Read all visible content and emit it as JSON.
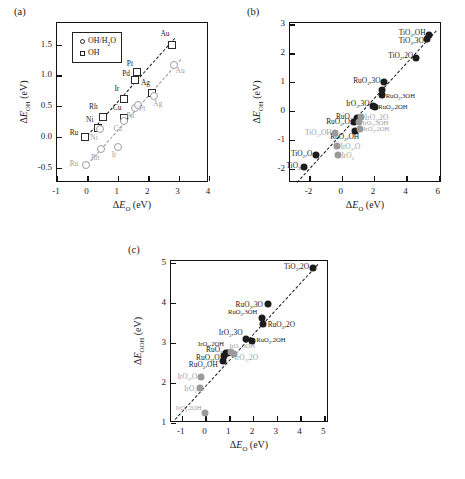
{
  "figure": {
    "background": "#ffffff",
    "colors": {
      "dark": "#1a1a1a",
      "gray": "#9d9d9d",
      "axis": "#111111"
    }
  },
  "panels": [
    {
      "tag": "(a)",
      "name": "panel-a",
      "chart_data": {
        "type": "scatter",
        "title": "",
        "xlabel": "ΔE_O (eV)",
        "ylabel": "ΔE_OH (eV)",
        "xlim": [
          -1,
          4
        ],
        "ylim": [
          -0.75,
          1.85
        ],
        "xticks": [
          -1,
          0,
          1,
          2,
          3,
          4
        ],
        "xticklabels": [
          "-1",
          "0",
          "1",
          "2",
          "3",
          "4"
        ],
        "yticks": [
          -0.5,
          0.0,
          0.5,
          1.0,
          1.5
        ],
        "yticklabels": [
          "-0.5",
          "0.0",
          "0.5",
          "1.0",
          "1.5"
        ],
        "grid": false,
        "legend_position": "upper-left",
        "legend": [
          {
            "label": "OH/H₂O",
            "marker": "circle-open"
          },
          {
            "label": "OH",
            "marker": "square-open"
          }
        ],
        "series": [
          {
            "name": "OH",
            "marker": "square-open",
            "color": "#2a2a2a",
            "points": [
              {
                "label": "Ru",
                "x": -0.08,
                "y": 0.0,
                "lx": -0.3,
                "ly": 0.06,
                "anchor": "right"
              },
              {
                "label": "Ni",
                "x": 0.36,
                "y": 0.14,
                "lx": 0.2,
                "ly": 0.28,
                "anchor": "right"
              },
              {
                "label": "Rh",
                "x": 0.52,
                "y": 0.33,
                "lx": 0.34,
                "ly": 0.48,
                "anchor": "right"
              },
              {
                "label": "Ir",
                "x": 1.2,
                "y": 0.62,
                "lx": 1.05,
                "ly": 0.77,
                "anchor": "right"
              },
              {
                "label": "Cu",
                "x": 1.22,
                "y": 0.3,
                "lx": 1.12,
                "ly": 0.47,
                "anchor": "right"
              },
              {
                "label": "Pd",
                "x": 1.55,
                "y": 0.93,
                "lx": 1.4,
                "ly": 1.02,
                "anchor": "right"
              },
              {
                "label": "Pt",
                "x": 1.62,
                "y": 1.06,
                "lx": 1.5,
                "ly": 1.19,
                "anchor": "right"
              },
              {
                "label": "Ag",
                "x": 2.14,
                "y": 0.71,
                "lx": 2.06,
                "ly": 0.88,
                "anchor": "right"
              },
              {
                "label": "Au",
                "x": 2.78,
                "y": 1.5,
                "lx": 2.7,
                "ly": 1.67,
                "anchor": "right"
              }
            ]
          },
          {
            "name": "OH/H2O",
            "marker": "circle-open",
            "color": "#9d9d9d",
            "points": [
              {
                "label": "Ru",
                "x": -0.05,
                "y": -0.46,
                "lx": -0.3,
                "ly": -0.44,
                "anchor": "right"
              },
              {
                "label": "Rh",
                "x": 0.44,
                "y": -0.2,
                "lx": 0.4,
                "ly": -0.34,
                "anchor": "right"
              },
              {
                "label": "Ni",
                "x": 0.4,
                "y": 0.13,
                "lx": 0.34,
                "ly": -0.02,
                "anchor": "right"
              },
              {
                "label": "Ir",
                "x": 1.0,
                "y": -0.16,
                "lx": 0.96,
                "ly": -0.3,
                "anchor": "right"
              },
              {
                "label": "Cu",
                "x": 1.2,
                "y": 0.26,
                "lx": 1.14,
                "ly": 0.13,
                "anchor": "right"
              },
              {
                "label": "Pd",
                "x": 1.58,
                "y": 0.47,
                "lx": 1.54,
                "ly": 0.34,
                "anchor": "right"
              },
              {
                "label": "Pt",
                "x": 1.66,
                "y": 0.52,
                "lx": 1.7,
                "ly": 0.45,
                "anchor": "left"
              },
              {
                "label": "Ag",
                "x": 2.18,
                "y": 0.66,
                "lx": 2.16,
                "ly": 0.53,
                "anchor": "left"
              },
              {
                "label": "Au",
                "x": 2.86,
                "y": 1.17,
                "lx": 2.9,
                "ly": 1.07,
                "anchor": "left"
              }
            ]
          }
        ],
        "trendlines": [
          {
            "name": "OH-fit",
            "color": "#1a1a1a",
            "x0": -0.12,
            "y0": -0.04,
            "x1": 2.86,
            "y1": 1.6
          },
          {
            "name": "OH-H2O-fit",
            "color": "#9a9a9a",
            "x0": -0.1,
            "y0": -0.5,
            "x1": 3.1,
            "y1": 1.28
          }
        ]
      }
    },
    {
      "tag": "(b)",
      "name": "panel-b",
      "chart_data": {
        "type": "scatter",
        "title": "",
        "xlabel": "ΔE_O (eV)",
        "ylabel": "ΔE_OH (eV)",
        "xlim": [
          -3.2,
          6.2
        ],
        "ylim": [
          -2.5,
          3.05
        ],
        "xticks": [
          -2,
          0,
          2,
          4,
          6
        ],
        "xticklabels": [
          "-2",
          "0",
          "2",
          "4",
          "6"
        ],
        "yticks": [
          -2,
          -1,
          0,
          1,
          2,
          3
        ],
        "yticklabels": [
          "-2",
          "-1",
          "0",
          "1",
          "2",
          "3"
        ],
        "grid": false,
        "series": [
          {
            "name": "dark-oxides",
            "marker": "circle-filled",
            "color": "#1c1c1c",
            "points": [
              {
                "label": "TiO₂",
                "x": -2.35,
                "y": -1.95,
                "lx": -2.55,
                "ly": -1.92,
                "anchor": "right"
              },
              {
                "label": "TiO₂,O",
                "x": -1.62,
                "y": -1.52,
                "lx": -1.82,
                "ly": -1.48,
                "anchor": "right"
              },
              {
                "label": "RuO₂,OH",
                "x": 0.82,
                "y": -0.68,
                "lx": 1.08,
                "ly": -0.92,
                "anchor": "right"
              },
              {
                "label": "RuO₂,O",
                "x": 0.76,
                "y": -0.4,
                "lx": 0.5,
                "ly": -0.38,
                "anchor": "right"
              },
              {
                "label": "RuO₂",
                "x": 0.92,
                "y": -0.26,
                "lx": 0.66,
                "ly": -0.2,
                "anchor": "right"
              },
              {
                "label": "IrO₂,3O",
                "x": 1.92,
                "y": 0.18,
                "lx": 1.72,
                "ly": 0.25,
                "anchor": "right"
              },
              {
                "label": "RuO₂,2OH",
                "x": 2.06,
                "y": 0.14,
                "lx": 2.26,
                "ly": 0.1,
                "anchor": "left"
              },
              {
                "label": "RuO₂,3OH",
                "x": 2.52,
                "y": 0.54,
                "lx": 2.72,
                "ly": 0.5,
                "anchor": "left"
              },
              {
                "label": "RuO₂,3O",
                "x": 2.62,
                "y": 0.99,
                "lx": 2.4,
                "ly": 1.04,
                "anchor": "right"
              },
              {
                "label": "",
                "x": 2.46,
                "y": 0.72,
                "lx": 0,
                "ly": 0,
                "anchor": "left"
              },
              {
                "label": "TiO₂,2O",
                "x": 4.62,
                "y": 1.82,
                "lx": 4.42,
                "ly": 1.9,
                "anchor": "right"
              },
              {
                "label": "TiO₂,3O",
                "x": 5.3,
                "y": 2.5,
                "lx": 5.08,
                "ly": 2.42,
                "anchor": "right"
              },
              {
                "label": "TiO₂,OH",
                "x": 5.4,
                "y": 2.62,
                "lx": 5.18,
                "ly": 2.7,
                "anchor": "right"
              }
            ]
          },
          {
            "name": "gray-oxides",
            "marker": "circle-filled-gray",
            "color": "#9a9a9a",
            "points": [
              {
                "label": "IrO₂",
                "x": -0.22,
                "y": -1.52,
                "lx": -0.02,
                "ly": -1.56,
                "anchor": "left"
              },
              {
                "label": "IrO₂,O",
                "x": -0.28,
                "y": -1.22,
                "lx": -0.08,
                "ly": -1.26,
                "anchor": "left"
              },
              {
                "label": "TiO₂,OH",
                "x": -0.4,
                "y": -0.78,
                "lx": -0.62,
                "ly": -0.76,
                "anchor": "right"
              },
              {
                "label": "IrO₂,2OH",
                "x": 1.12,
                "y": -0.62,
                "lx": 1.34,
                "ly": -0.66,
                "anchor": "left"
              },
              {
                "label": "IrO₂,3OH",
                "x": 1.04,
                "y": -0.4,
                "lx": 1.28,
                "ly": -0.44,
                "anchor": "left"
              },
              {
                "label": "IrO₂,2O",
                "x": 1.18,
                "y": -0.2,
                "lx": 1.42,
                "ly": -0.24,
                "anchor": "left"
              }
            ]
          }
        ],
        "trendlines": [
          {
            "name": "oxide-fit",
            "color": "#1a1a1a",
            "x0": -2.75,
            "y0": -2.45,
            "x1": 5.85,
            "y1": 2.8
          }
        ]
      }
    },
    {
      "tag": "(c)",
      "name": "panel-c",
      "chart_data": {
        "type": "scatter",
        "title": "",
        "xlabel": "ΔE_O (eV)",
        "ylabel": "ΔE_OOH (eV)",
        "xlim": [
          -1.45,
          5.2
        ],
        "ylim": [
          1.0,
          5.05
        ],
        "xticks": [
          -1,
          0,
          1,
          2,
          3,
          4,
          5
        ],
        "xticklabels": [
          "-1",
          "0",
          "1",
          "2",
          "3",
          "4",
          "5"
        ],
        "yticks": [
          1,
          2,
          3,
          4,
          5
        ],
        "yticklabels": [
          "1",
          "2",
          "3",
          "4",
          "5"
        ],
        "grid": false,
        "series": [
          {
            "name": "dark-oxides",
            "marker": "circle-filled",
            "color": "#1c1c1c",
            "points": [
              {
                "label": "RuO₂,OH",
                "x": 0.72,
                "y": 2.56,
                "lx": 0.52,
                "ly": 2.44,
                "anchor": "right"
              },
              {
                "label": "RuO₂,O",
                "x": 0.8,
                "y": 2.68,
                "lx": 0.6,
                "ly": 2.62,
                "anchor": "right"
              },
              {
                "label": "RuO₂",
                "x": 0.86,
                "y": 2.76,
                "lx": 0.72,
                "ly": 2.82,
                "anchor": "right"
              },
              {
                "label": "IrO₂,2OH",
                "x": 0.96,
                "y": 2.76,
                "lx": 0.78,
                "ly": 2.94,
                "anchor": "right"
              },
              {
                "label": "IrO₂,3O",
                "x": 1.7,
                "y": 3.1,
                "lx": 1.56,
                "ly": 3.24,
                "anchor": "right"
              },
              {
                "label": "RuO₂,2OH",
                "x": 1.96,
                "y": 3.06,
                "lx": 2.14,
                "ly": 3.04,
                "anchor": "left"
              },
              {
                "label": "RuO₂,2O",
                "x": 2.44,
                "y": 3.48,
                "lx": 2.62,
                "ly": 3.46,
                "anchor": "left"
              },
              {
                "label": "RuO₂,3OH",
                "x": 2.36,
                "y": 3.62,
                "lx": 2.18,
                "ly": 3.74,
                "anchor": "right"
              },
              {
                "label": "RuO₂,3O",
                "x": 2.62,
                "y": 3.98,
                "lx": 2.42,
                "ly": 3.96,
                "anchor": "right"
              },
              {
                "label": "TiO₂,2O",
                "x": 4.54,
                "y": 4.88,
                "lx": 4.36,
                "ly": 4.9,
                "anchor": "right"
              }
            ]
          },
          {
            "name": "gray-oxides",
            "marker": "circle-filled-gray",
            "color": "#9a9a9a",
            "points": [
              {
                "label": "IrO₂",
                "x": -0.22,
                "y": 1.88,
                "lx": -0.36,
                "ly": 1.86,
                "anchor": "right"
              },
              {
                "label": "IrO₂,O",
                "x": -0.18,
                "y": 2.14,
                "lx": -0.34,
                "ly": 2.14,
                "anchor": "right"
              },
              {
                "label": "IrO₂,2OH",
                "x": -0.04,
                "y": 1.26,
                "lx": -0.16,
                "ly": 1.34,
                "anchor": "right"
              },
              {
                "label": "IrO₂,3OH",
                "x": 1.08,
                "y": 2.78,
                "lx": 1.0,
                "ly": 2.9,
                "anchor": "left"
              },
              {
                "label": "IrO₂,2O",
                "x": 1.2,
                "y": 2.72,
                "lx": 1.22,
                "ly": 2.62,
                "anchor": "left"
              }
            ]
          }
        ],
        "trendlines": [
          {
            "name": "oxide-fit",
            "color": "#1a1a1a",
            "x0": -1.3,
            "y0": 1.1,
            "x1": 4.72,
            "y1": 4.98
          }
        ]
      }
    }
  ]
}
